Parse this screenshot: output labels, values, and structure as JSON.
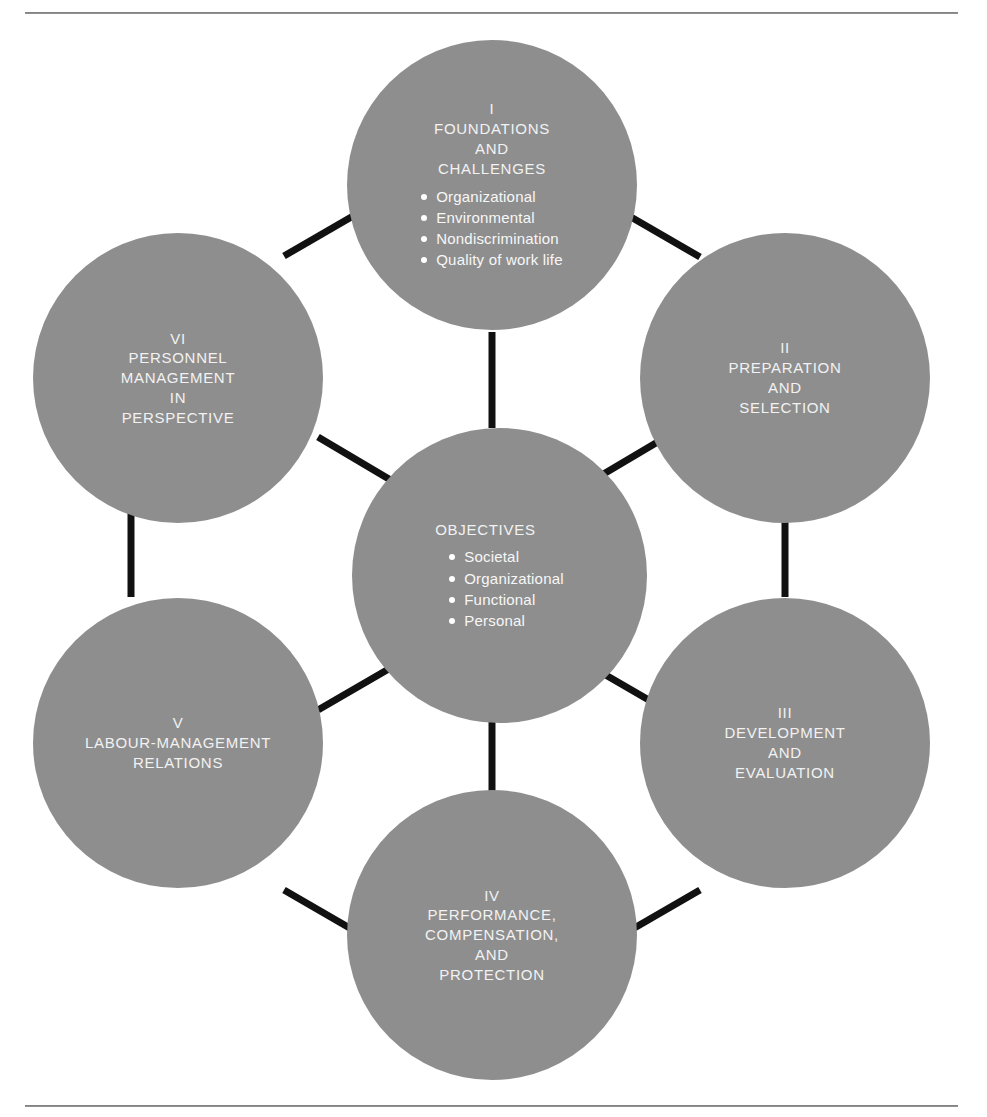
{
  "diagram": {
    "type": "hub-and-spoke hexagon",
    "background_color": "#ffffff",
    "node_fill_color": "#8e8e8e",
    "node_text_color": "#ffffff",
    "connector_color": "#000000",
    "center": {
      "id": "objectives",
      "title": "OBJECTIVES",
      "bullets": [
        "Societal",
        "Organizational",
        "Functional",
        "Personal"
      ]
    },
    "nodes": [
      {
        "id": "part-1",
        "numeral": "I",
        "title": "I\nFOUNDATIONS\nAND\nCHALLENGES",
        "bullets": [
          "Organizational",
          "Environmental",
          "Nondiscrimination",
          "Quality of work life"
        ]
      },
      {
        "id": "part-2",
        "numeral": "II",
        "title": "II\nPREPARATION\nAND\nSELECTION",
        "bullets": []
      },
      {
        "id": "part-3",
        "numeral": "III",
        "title": "III\nDEVELOPMENT\nAND\nEVALUATION",
        "bullets": []
      },
      {
        "id": "part-4",
        "numeral": "IV",
        "title": "IV\nPERFORMANCE,\nCOMPENSATION,\nAND\nPROTECTION",
        "bullets": []
      },
      {
        "id": "part-5",
        "numeral": "V",
        "title": "V\nLABOUR-MANAGEMENT\nRELATIONS",
        "bullets": []
      },
      {
        "id": "part-6",
        "numeral": "VI",
        "title": "VI\nPERSONNEL\nMANAGEMENT\nIN\nPERSPECTIVE",
        "bullets": []
      }
    ]
  }
}
